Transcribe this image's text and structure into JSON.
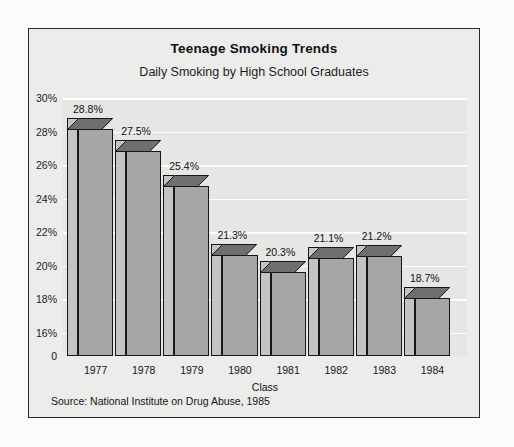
{
  "chart_data": {
    "type": "bar",
    "title": "Teenage Smoking Trends",
    "subtitle": "Daily Smoking by High School Graduates",
    "xlabel": "Class",
    "ylabel": "",
    "categories": [
      "1977",
      "1978",
      "1979",
      "1980",
      "1981",
      "1982",
      "1983",
      "1984"
    ],
    "values": [
      28.8,
      27.5,
      25.4,
      21.3,
      20.3,
      21.1,
      21.2,
      18.7
    ],
    "value_labels": [
      "28.8%",
      "27.5%",
      "25.4%",
      "21.3%",
      "20.3%",
      "21.1%",
      "21.2%",
      "18.7%"
    ],
    "ytick_labels": [
      "30%",
      "28%",
      "26%",
      "24%",
      "22%",
      "20%",
      "18%",
      "16%",
      "0"
    ],
    "ytick_values": [
      30,
      28,
      26,
      24,
      22,
      20,
      18,
      16,
      0
    ],
    "ylim": [
      14.6,
      30
    ],
    "grid": true,
    "legend": false,
    "source": "Source: National Institute on Drug Abuse, 1985",
    "colors": {
      "bar_front": "#a6a6a6",
      "bar_side": "#c4c4c4",
      "bar_top": "#6f6f6f",
      "outline": "#161616",
      "plot_background": "#e6e6e5",
      "frame_background": "#ececeb",
      "gridline": "#fdfdfd",
      "text": "#111111"
    }
  }
}
